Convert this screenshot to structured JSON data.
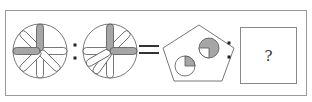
{
  "puzzle": {
    "type": "analogy",
    "relation": "A : B = C : ?",
    "colors": {
      "stroke": "#555555",
      "gray_fill": "#a6a6a6",
      "frame": "#999999",
      "background": "#ffffff"
    },
    "figure_a": {
      "shape": "circle-with-petals",
      "gray_petals": [
        "up",
        "left"
      ],
      "white_petals": [
        "up-left",
        "right",
        "down",
        "down-right",
        "down-left"
      ]
    },
    "figure_b": {
      "shape": "circle-with-petals",
      "gray_petals": [
        "up",
        "right"
      ],
      "white_petals": [
        "up-right",
        "left",
        "down",
        "down-left",
        "down-right"
      ]
    },
    "figure_c": {
      "shape": "pentagon",
      "inner": [
        {
          "position": "upper-right",
          "shaded_quadrants": 3,
          "white_quadrant": "bottom-left"
        },
        {
          "position": "lower-left",
          "shaded_quadrants": 1,
          "shaded_quadrant": "top-right"
        }
      ]
    },
    "answer_box": {
      "label": "?"
    },
    "symbols": {
      "colon": ":",
      "equals": "="
    }
  }
}
